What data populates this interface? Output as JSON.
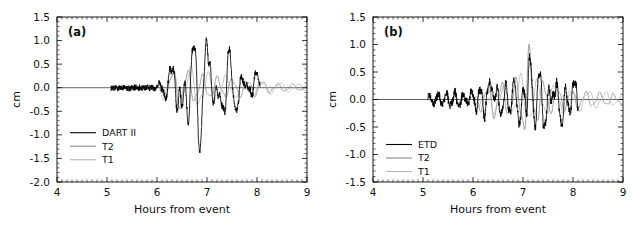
{
  "figure": {
    "background": "#ffffff",
    "width": 632,
    "height": 228
  },
  "chart_data": [
    {
      "type": "line",
      "panel_tag": "(a)",
      "title": "",
      "xlabel": "Hours from event",
      "ylabel": "cm",
      "xlim": [
        4,
        9
      ],
      "ylim": [
        -2.0,
        1.5
      ],
      "xticks": [
        4,
        5,
        6,
        7,
        8,
        9
      ],
      "xtick_labels": [
        "4",
        "5",
        "6",
        "7",
        "8",
        "9"
      ],
      "yticks": [
        1.5,
        1.0,
        0.5,
        0.0,
        -0.5,
        -1.0,
        -1.5,
        -2.0
      ],
      "ytick_labels": [
        "1.5",
        "1.0",
        "0.5",
        "0.0",
        "-0.5",
        "-1.0",
        "-1.5",
        "-2.0"
      ],
      "minor_ticks_per_interval": 10,
      "grid": false,
      "zero_line": true,
      "legend_position": "lower-left",
      "series": [
        {
          "name": "DART II",
          "color": "#000000",
          "width": 0.85,
          "kind": "observed",
          "x_start": 5.08,
          "x_end": 8.06,
          "noise_amp": 0.055,
          "seed": 17,
          "envelope": [
            {
              "t": 5.08,
              "a": 0.0
            },
            {
              "t": 5.95,
              "a": 0.02
            },
            {
              "t": 6.1,
              "a": 0.18
            },
            {
              "t": 6.32,
              "a": 0.55
            },
            {
              "t": 6.55,
              "a": 0.62
            },
            {
              "t": 6.72,
              "a": 1.0
            },
            {
              "t": 6.88,
              "a": 1.15
            },
            {
              "t": 7.05,
              "a": 1.12
            },
            {
              "t": 7.25,
              "a": 0.72
            },
            {
              "t": 7.45,
              "a": 0.85
            },
            {
              "t": 7.65,
              "a": 0.45
            },
            {
              "t": 7.85,
              "a": 0.4
            },
            {
              "t": 8.0,
              "a": 0.66
            },
            {
              "t": 8.06,
              "a": 0.1
            }
          ],
          "period": 0.235,
          "phase": 0.35,
          "peaks": [
            {
              "t": 6.33,
              "v": 0.55
            },
            {
              "t": 6.5,
              "v": -0.78
            },
            {
              "t": 6.72,
              "v": 1.03
            },
            {
              "t": 6.86,
              "v": -1.5
            },
            {
              "t": 7.06,
              "v": 1.13
            },
            {
              "t": 7.22,
              "v": -0.62
            },
            {
              "t": 7.45,
              "v": 0.83
            },
            {
              "t": 7.62,
              "v": -0.55
            },
            {
              "t": 7.8,
              "v": 0.28
            },
            {
              "t": 7.9,
              "v": -0.42
            },
            {
              "t": 8.01,
              "v": 0.65
            }
          ]
        },
        {
          "name": "T2",
          "color": "#8a8a8a",
          "width": 0.8,
          "kind": "model",
          "x_start": 5.95,
          "x_end": 9.0,
          "noise_amp": 0.0,
          "seed": 41,
          "envelope": [
            {
              "t": 5.95,
              "a": 0.0
            },
            {
              "t": 6.15,
              "a": 0.22
            },
            {
              "t": 6.35,
              "a": 0.5
            },
            {
              "t": 6.6,
              "a": 0.42
            },
            {
              "t": 6.9,
              "a": 0.3
            },
            {
              "t": 7.2,
              "a": 0.26
            },
            {
              "t": 7.55,
              "a": 0.22
            },
            {
              "t": 7.95,
              "a": 0.2
            },
            {
              "t": 8.4,
              "a": 0.1
            },
            {
              "t": 9.0,
              "a": 0.07
            }
          ],
          "period": 0.3,
          "phase": 0.1
        },
        {
          "name": "T1",
          "color": "#b4b4b4",
          "width": 0.8,
          "kind": "model",
          "x_start": 5.95,
          "x_end": 9.0,
          "noise_amp": 0.0,
          "seed": 73,
          "envelope": [
            {
              "t": 5.95,
              "a": 0.0
            },
            {
              "t": 6.18,
              "a": 0.3
            },
            {
              "t": 6.36,
              "a": 0.48
            },
            {
              "t": 6.7,
              "a": 0.52
            },
            {
              "t": 7.0,
              "a": 0.34
            },
            {
              "t": 7.35,
              "a": 0.28
            },
            {
              "t": 7.75,
              "a": 0.24
            },
            {
              "t": 8.2,
              "a": 0.14
            },
            {
              "t": 9.0,
              "a": 0.08
            }
          ],
          "period": 0.36,
          "phase": 0.55
        }
      ]
    },
    {
      "type": "line",
      "panel_tag": "(b)",
      "title": "",
      "xlabel": "Hours from event",
      "ylabel": "cm",
      "xlim": [
        4,
        9
      ],
      "ylim": [
        -1.5,
        1.5
      ],
      "xticks": [
        4,
        5,
        6,
        7,
        8,
        9
      ],
      "xtick_labels": [
        "4",
        "5",
        "6",
        "7",
        "8",
        "9"
      ],
      "yticks": [
        1.5,
        1.0,
        0.5,
        0.0,
        -0.5,
        -1.0,
        -1.5
      ],
      "ytick_labels": [
        "1.5",
        "1.0",
        "0.5",
        "0.0",
        "-0.5",
        "-1.0",
        "-1.5"
      ],
      "minor_ticks_per_interval": 10,
      "grid": false,
      "zero_line": true,
      "legend_position": "lower-left",
      "series": [
        {
          "name": "ETD",
          "color": "#000000",
          "width": 0.85,
          "kind": "observed",
          "x_start": 5.1,
          "x_end": 8.1,
          "noise_amp": 0.06,
          "seed": 29,
          "envelope": [
            {
              "t": 5.1,
              "a": 0.1
            },
            {
              "t": 5.4,
              "a": 0.12
            },
            {
              "t": 5.62,
              "a": 0.16
            },
            {
              "t": 5.85,
              "a": 0.1
            },
            {
              "t": 6.05,
              "a": 0.22
            },
            {
              "t": 6.3,
              "a": 0.42
            },
            {
              "t": 6.55,
              "a": 0.3
            },
            {
              "t": 6.8,
              "a": 0.4
            },
            {
              "t": 7.0,
              "a": 0.52
            },
            {
              "t": 7.15,
              "a": 0.98
            },
            {
              "t": 7.35,
              "a": 0.55
            },
            {
              "t": 7.55,
              "a": 0.3
            },
            {
              "t": 7.75,
              "a": 0.36
            },
            {
              "t": 7.95,
              "a": 0.3
            },
            {
              "t": 8.1,
              "a": 0.4
            }
          ],
          "period": 0.17,
          "phase": 0.2,
          "peaks": [
            {
              "t": 6.38,
              "v": 0.4
            },
            {
              "t": 6.55,
              "v": -0.3
            },
            {
              "t": 6.82,
              "v": 0.32
            },
            {
              "t": 6.95,
              "v": -0.48
            },
            {
              "t": 7.12,
              "v": 0.98
            },
            {
              "t": 7.22,
              "v": -0.35
            },
            {
              "t": 7.32,
              "v": 0.52
            },
            {
              "t": 7.45,
              "v": -0.58
            },
            {
              "t": 7.6,
              "v": 0.25
            },
            {
              "t": 7.78,
              "v": -0.58
            },
            {
              "t": 8.05,
              "v": 0.4
            }
          ]
        },
        {
          "name": "T2",
          "color": "#8a8a8a",
          "width": 0.8,
          "kind": "model",
          "x_start": 5.95,
          "x_end": 9.0,
          "noise_amp": 0.0,
          "seed": 53,
          "envelope": [
            {
              "t": 5.95,
              "a": 0.0
            },
            {
              "t": 6.18,
              "a": 0.24
            },
            {
              "t": 6.4,
              "a": 0.38
            },
            {
              "t": 6.7,
              "a": 0.34
            },
            {
              "t": 6.95,
              "a": 0.45
            },
            {
              "t": 7.08,
              "a": 1.1
            },
            {
              "t": 7.3,
              "a": 0.45
            },
            {
              "t": 7.6,
              "a": 0.26
            },
            {
              "t": 8.0,
              "a": 0.2
            },
            {
              "t": 8.5,
              "a": 0.14
            },
            {
              "t": 9.0,
              "a": 0.1
            }
          ],
          "period": 0.28,
          "phase": 0.05
        },
        {
          "name": "T1",
          "color": "#b4b4b4",
          "width": 0.8,
          "kind": "model",
          "x_start": 5.95,
          "x_end": 9.0,
          "noise_amp": 0.0,
          "seed": 91,
          "envelope": [
            {
              "t": 5.95,
              "a": 0.0
            },
            {
              "t": 6.2,
              "a": 0.2
            },
            {
              "t": 6.45,
              "a": 0.3
            },
            {
              "t": 6.8,
              "a": 0.35
            },
            {
              "t": 7.05,
              "a": 0.55
            },
            {
              "t": 7.25,
              "a": 0.4
            },
            {
              "t": 7.6,
              "a": 0.3
            },
            {
              "t": 8.05,
              "a": 0.22
            },
            {
              "t": 8.6,
              "a": 0.16
            },
            {
              "t": 9.0,
              "a": 0.12
            }
          ],
          "period": 0.34,
          "phase": 0.62
        }
      ]
    }
  ]
}
